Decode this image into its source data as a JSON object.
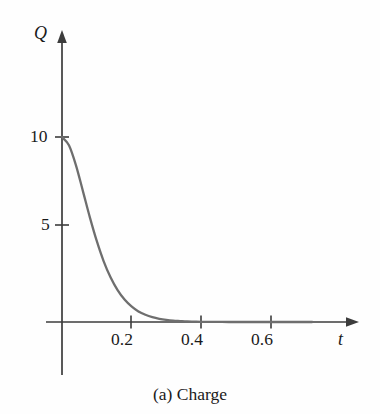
{
  "figure": {
    "caption": "(a) Charge",
    "background_color": "#fefefe"
  },
  "chart_data": {
    "type": "line",
    "title": "",
    "subtitle": "",
    "caption": "(a) Charge",
    "xlabel": "t",
    "ylabel": "Q",
    "xlim": [
      0,
      0.72
    ],
    "ylim": [
      0,
      11.5
    ],
    "xticks": [
      0.2,
      0.4,
      0.6
    ],
    "xtick_labels": [
      "0.2",
      "0.4",
      "0.6"
    ],
    "yticks": [
      5,
      10
    ],
    "ytick_labels": [
      "5",
      "10"
    ],
    "grid": false,
    "legend": null,
    "axis_style": "arrow-ended axes through origin",
    "series": [
      {
        "name": "Q(t)",
        "color": "#6e6e6e",
        "description": "critically damped capacitor charge decay, starts at Q=10 with zero slope and decays to 0",
        "x": [
          0.0,
          0.02,
          0.04,
          0.06,
          0.08,
          0.1,
          0.12,
          0.14,
          0.16,
          0.18,
          0.2,
          0.22,
          0.24,
          0.26,
          0.28,
          0.3,
          0.32,
          0.34,
          0.36,
          0.38,
          0.4,
          0.44,
          0.48,
          0.52,
          0.56,
          0.6,
          0.64,
          0.68,
          0.72
        ],
        "y": [
          10.0,
          9.55,
          8.48,
          7.09,
          5.67,
          4.38,
          3.28,
          2.4,
          1.72,
          1.21,
          0.84,
          0.57,
          0.39,
          0.26,
          0.17,
          0.11,
          0.07,
          0.05,
          0.03,
          0.02,
          0.01,
          0.01,
          0.0,
          0.0,
          0.0,
          0.0,
          0.0,
          0.0,
          0.0
        ]
      }
    ],
    "annotations": [
      {
        "name": "y-axis-label",
        "text": "Q"
      },
      {
        "name": "x-axis-label",
        "text": "t"
      }
    ]
  },
  "colors": {
    "curve": "#6e6e6e",
    "axis": "#3c3c3c",
    "text": "#1a1a1a",
    "background": "#fefefe"
  }
}
